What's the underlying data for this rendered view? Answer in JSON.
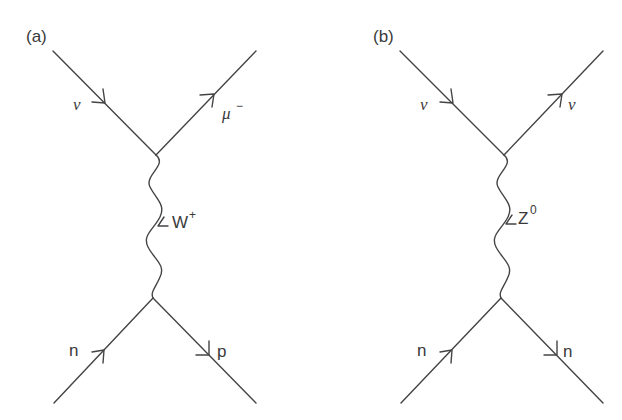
{
  "colors": {
    "line": "#444444",
    "text": "#3a3a3a",
    "background": "#ffffff"
  },
  "diagrams": [
    {
      "panel_label": "(a)",
      "process": "charged-current neutrino scattering",
      "incoming_top": "ν",
      "outgoing_top": "μ",
      "outgoing_top_sup": "−",
      "boson": "W",
      "boson_sup": "+",
      "incoming_bottom": "n",
      "outgoing_bottom": "p"
    },
    {
      "panel_label": "(b)",
      "process": "neutral-current neutrino scattering",
      "incoming_top": "ν",
      "outgoing_top": "ν",
      "outgoing_top_sup": "",
      "boson": "Z",
      "boson_sup": "0",
      "incoming_bottom": "n",
      "outgoing_bottom": "n"
    }
  ]
}
